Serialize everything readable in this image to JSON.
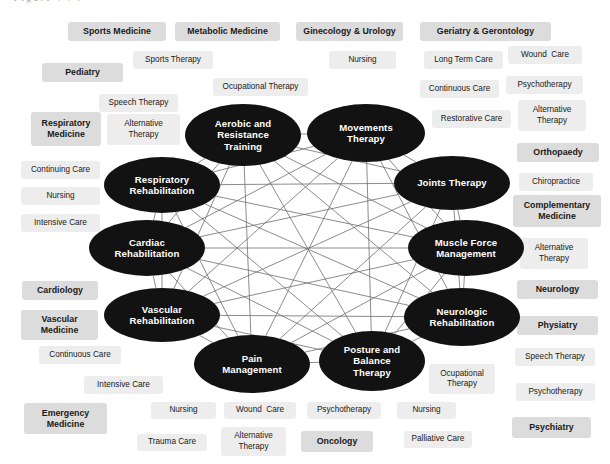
{
  "figure": {
    "clipped_header_text": "Figure .  .  .",
    "type": "network-diagram",
    "background_color": "#ffffff",
    "node_color": "#121212",
    "node_text_color": "#ffffff",
    "specialty_chip_color": "#dcdcdc",
    "subdiscipline_chip_color": "#ededed",
    "edge_color": "#6f6f6f"
  },
  "nodes": [
    {
      "id": "aerobic",
      "label": "Aerobic and\nResistance\nTraining",
      "cx": 243,
      "cy": 135,
      "rx": 58,
      "ry": 31
    },
    {
      "id": "movements",
      "label": "Movements\nTherapy",
      "cx": 366,
      "cy": 133,
      "rx": 59,
      "ry": 29
    },
    {
      "id": "joints",
      "label": "Joints Therapy",
      "cx": 452,
      "cy": 183,
      "rx": 58,
      "ry": 27
    },
    {
      "id": "muscle",
      "label": "Muscle Force\nManagement",
      "cx": 466,
      "cy": 248,
      "rx": 58,
      "ry": 28
    },
    {
      "id": "neurologic",
      "label": "Neurologic\nRehabilitation",
      "cx": 462,
      "cy": 317,
      "rx": 58,
      "ry": 29
    },
    {
      "id": "posture",
      "label": "Posture and\nBalance\nTherapy",
      "cx": 372,
      "cy": 361,
      "rx": 53,
      "ry": 30
    },
    {
      "id": "pain",
      "label": "Pain\nManagement",
      "cx": 252,
      "cy": 364,
      "rx": 58,
      "ry": 29
    },
    {
      "id": "vascular",
      "label": "Vascular\nRehabilitation",
      "cx": 162,
      "cy": 315,
      "rx": 58,
      "ry": 27
    },
    {
      "id": "cardiac",
      "label": "Cardiac\nRehabilitation",
      "cx": 147,
      "cy": 248,
      "rx": 58,
      "ry": 28
    },
    {
      "id": "respiratory",
      "label": "Respiratory\nRehabilitation",
      "cx": 162,
      "cy": 185,
      "rx": 58,
      "ry": 28
    }
  ],
  "tags": [
    {
      "label": "Sports Medicine",
      "kind": "spec",
      "x": 68,
      "y": 22,
      "w": 98,
      "h": 19
    },
    {
      "label": "Metabolic Medicine",
      "kind": "spec",
      "x": 175,
      "y": 22,
      "w": 105,
      "h": 19
    },
    {
      "label": "Ginecology & Urology",
      "kind": "spec",
      "x": 296,
      "y": 22,
      "w": 107,
      "h": 19
    },
    {
      "label": "Geriatry & Gerontology",
      "kind": "spec",
      "x": 420,
      "y": 22,
      "w": 131,
      "h": 19
    },
    {
      "label": "Sports Therapy",
      "kind": "sub",
      "x": 133,
      "y": 51,
      "w": 80,
      "h": 18
    },
    {
      "label": "Nursing",
      "kind": "sub",
      "x": 329,
      "y": 51,
      "w": 67,
      "h": 18
    },
    {
      "label": "Long Term Care",
      "kind": "sub",
      "x": 424,
      "y": 51,
      "w": 79,
      "h": 18
    },
    {
      "label": "Wound  Care",
      "kind": "sub",
      "x": 508,
      "y": 46,
      "w": 74,
      "h": 18
    },
    {
      "label": "Pediatry",
      "kind": "spec",
      "x": 42,
      "y": 63,
      "w": 81,
      "h": 19
    },
    {
      "label": "Ocupational Therapy",
      "kind": "sub",
      "x": 213,
      "y": 78,
      "w": 95,
      "h": 18
    },
    {
      "label": "Continuous Care",
      "kind": "sub",
      "x": 420,
      "y": 80,
      "w": 79,
      "h": 18
    },
    {
      "label": "Psychotherapy",
      "kind": "sub",
      "x": 506,
      "y": 76,
      "w": 77,
      "h": 18
    },
    {
      "label": "Speech Therapy",
      "kind": "sub",
      "x": 99,
      "y": 94,
      "w": 79,
      "h": 18
    },
    {
      "label": "Restorative Care",
      "kind": "sub",
      "x": 432,
      "y": 110,
      "w": 79,
      "h": 18
    },
    {
      "label": "Alternative\nTherapy",
      "kind": "sub",
      "x": 518,
      "y": 100,
      "w": 68,
      "h": 31
    },
    {
      "label": "Respiratory\nMedicine",
      "kind": "spec",
      "x": 31,
      "y": 112,
      "w": 70,
      "h": 34
    },
    {
      "label": "Alternative\nTherapy",
      "kind": "sub",
      "x": 107,
      "y": 114,
      "w": 73,
      "h": 31
    },
    {
      "label": "Orthopaedy",
      "kind": "spec",
      "x": 517,
      "y": 143,
      "w": 82,
      "h": 19
    },
    {
      "label": "Continuing Care",
      "kind": "sub",
      "x": 21,
      "y": 161,
      "w": 79,
      "h": 18
    },
    {
      "label": "Chiropractice",
      "kind": "sub",
      "x": 519,
      "y": 173,
      "w": 74,
      "h": 18
    },
    {
      "label": "Nursing",
      "kind": "sub",
      "x": 21,
      "y": 187,
      "w": 79,
      "h": 18
    },
    {
      "label": "Complementary\nMedicine",
      "kind": "spec",
      "x": 513,
      "y": 195,
      "w": 88,
      "h": 32
    },
    {
      "label": "Intensive Care",
      "kind": "sub",
      "x": 21,
      "y": 214,
      "w": 79,
      "h": 18
    },
    {
      "label": "Alternative\nTherapy",
      "kind": "sub",
      "x": 520,
      "y": 238,
      "w": 68,
      "h": 31
    },
    {
      "label": "Cardiology",
      "kind": "spec",
      "x": 22,
      "y": 281,
      "w": 76,
      "h": 19
    },
    {
      "label": "Neurology",
      "kind": "spec",
      "x": 517,
      "y": 280,
      "w": 81,
      "h": 19
    },
    {
      "label": "Vascular\nMedicine",
      "kind": "spec",
      "x": 21,
      "y": 310,
      "w": 77,
      "h": 30
    },
    {
      "label": "Physiatry",
      "kind": "spec",
      "x": 517,
      "y": 316,
      "w": 81,
      "h": 19
    },
    {
      "label": "Continuous Care",
      "kind": "sub",
      "x": 39,
      "y": 346,
      "w": 82,
      "h": 18
    },
    {
      "label": "Speech Therapy",
      "kind": "sub",
      "x": 515,
      "y": 348,
      "w": 80,
      "h": 18
    },
    {
      "label": "Intensive Care",
      "kind": "sub",
      "x": 84,
      "y": 376,
      "w": 79,
      "h": 18
    },
    {
      "label": "Ocupational\nTherapy",
      "kind": "sub",
      "x": 429,
      "y": 364,
      "w": 66,
      "h": 30
    },
    {
      "label": "Psychotherapy",
      "kind": "sub",
      "x": 516,
      "y": 383,
      "w": 79,
      "h": 18
    },
    {
      "label": "Emergency\nMedicine",
      "kind": "spec",
      "x": 24,
      "y": 403,
      "w": 83,
      "h": 31
    },
    {
      "label": "Nursing",
      "kind": "sub",
      "x": 151,
      "y": 402,
      "w": 65,
      "h": 17
    },
    {
      "label": "Wound  Care",
      "kind": "sub",
      "x": 224,
      "y": 402,
      "w": 72,
      "h": 17
    },
    {
      "label": "Psychotherapy",
      "kind": "sub",
      "x": 307,
      "y": 402,
      "w": 74,
      "h": 17
    },
    {
      "label": "Nursing",
      "kind": "sub",
      "x": 397,
      "y": 402,
      "w": 59,
      "h": 17
    },
    {
      "label": "Psychiatry",
      "kind": "spec",
      "x": 512,
      "y": 417,
      "w": 79,
      "h": 21
    },
    {
      "label": "Trauma Care",
      "kind": "sub",
      "x": 137,
      "y": 434,
      "w": 70,
      "h": 17
    },
    {
      "label": "Alternative\nTherapy",
      "kind": "sub",
      "x": 221,
      "y": 427,
      "w": 65,
      "h": 29
    },
    {
      "label": "Oncology",
      "kind": "spec",
      "x": 301,
      "y": 431,
      "w": 72,
      "h": 21
    },
    {
      "label": "Palliative Care",
      "kind": "sub",
      "x": 404,
      "y": 431,
      "w": 68,
      "h": 17
    }
  ]
}
